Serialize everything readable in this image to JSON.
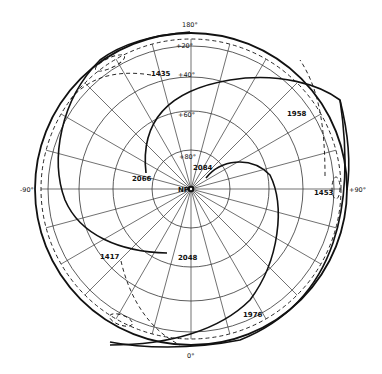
{
  "diagram": {
    "type": "polar-projection",
    "center_label": "NP",
    "longitude_labels": {
      "top": "180°",
      "bottom": "0°",
      "left": "-90°",
      "right": "+90°"
    },
    "latitude_labels": [
      "+20°",
      "+40°",
      "+60°",
      "+80°"
    ],
    "year_labels": {
      "y1435": "1435",
      "y1958": "1958",
      "y2066": "2066",
      "y2084": "2084",
      "y1453": "1453",
      "y1417": "1417",
      "y2048": "2048",
      "y1976": "1976"
    },
    "colors": {
      "ink": "#111111",
      "grid": "#333333",
      "background": "#ffffff"
    }
  }
}
